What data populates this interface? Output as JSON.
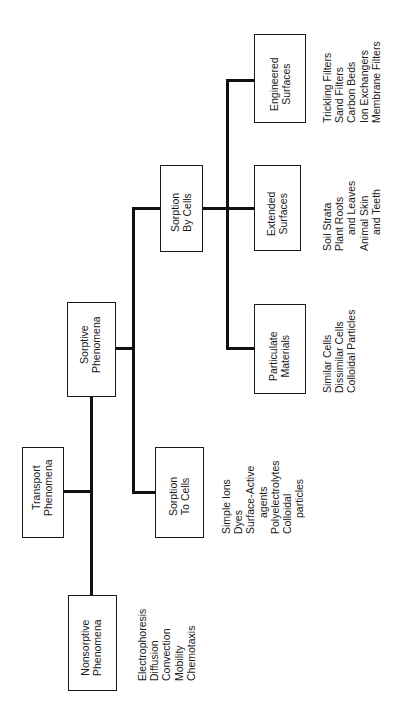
{
  "diagram": {
    "title": "",
    "orientation": "rotated -90deg (read bottom to top)",
    "nodes": {
      "nonsorptive": {
        "line1": "Nonsorptive",
        "line2": "Phenomena"
      },
      "transport": {
        "line1": "Transport",
        "line2": "Phenomena"
      },
      "sorptive": {
        "line1": "Sorptive",
        "line2": "Phenomena"
      },
      "sorption_to_cells": {
        "line1": "Sorption",
        "line2": "To Cells"
      },
      "sorption_by_cells": {
        "line1": "Sorption",
        "line2": "By Cells"
      },
      "particulate": {
        "line1": "Particulate",
        "line2": "Materials"
      },
      "extended": {
        "line1": "Extended",
        "line2": "Surfaces"
      },
      "engineered": {
        "line1": "Engineered",
        "line2": "Surfaces"
      }
    },
    "edges": [
      [
        "transport",
        "nonsorptive"
      ],
      [
        "transport",
        "sorptive"
      ],
      [
        "sorptive",
        "sorption_to_cells"
      ],
      [
        "sorptive",
        "sorption_by_cells"
      ],
      [
        "sorption_by_cells",
        "particulate"
      ],
      [
        "sorption_by_cells",
        "extended"
      ],
      [
        "sorption_by_cells",
        "engineered"
      ]
    ],
    "lists": {
      "nonsorptive": [
        "Electrophoresis",
        "Diffusion",
        "Convection",
        "Mobility",
        "Chemotaxis"
      ],
      "sorption_to_cells": [
        "Simple Ions",
        "Dyes",
        "Surface-Active",
        "agents",
        "Polyelectrolytes",
        "Colloidal",
        "particles"
      ],
      "particulate": [
        "Similar Cells",
        "Dissimilar Cells",
        "Colloidal Particles"
      ],
      "extended": [
        "Soil Strata",
        "Plant Roots",
        "and Leaves",
        "Animal Skin",
        "and Teeth"
      ],
      "engineered": [
        "Trickling Filters",
        "Sand Filters",
        "Carbon Beds",
        "Ion Exchangers",
        "Membrane Filters"
      ]
    }
  }
}
